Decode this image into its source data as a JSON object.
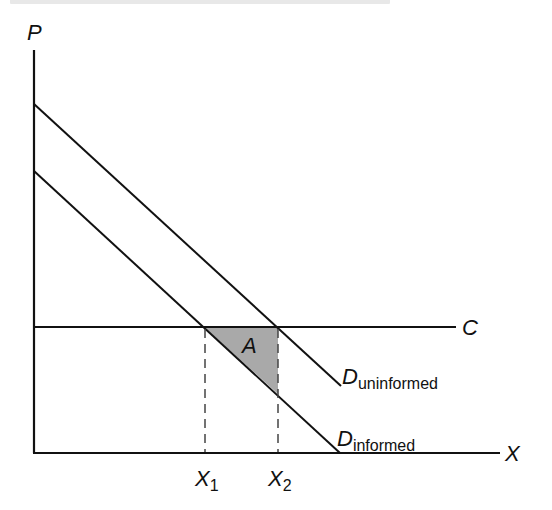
{
  "caption": {
    "visible": true,
    "legible": false,
    "text": null
  },
  "axes": {
    "y_label": "P",
    "x_label": "X"
  },
  "lines": {
    "cost": {
      "label": "C"
    },
    "demand_uninformed": {
      "label_main": "D",
      "label_sub": "uninformed"
    },
    "demand_informed": {
      "label_main": "D",
      "label_sub": "informed"
    }
  },
  "ticks": [
    {
      "main": "X",
      "sub": "1"
    },
    {
      "main": "X",
      "sub": "2"
    }
  ],
  "region": {
    "label": "A",
    "fill": "#a9a9a9"
  },
  "colors": {
    "line": "#111111",
    "dash": "#444444",
    "shade": "#a9a9a9"
  }
}
